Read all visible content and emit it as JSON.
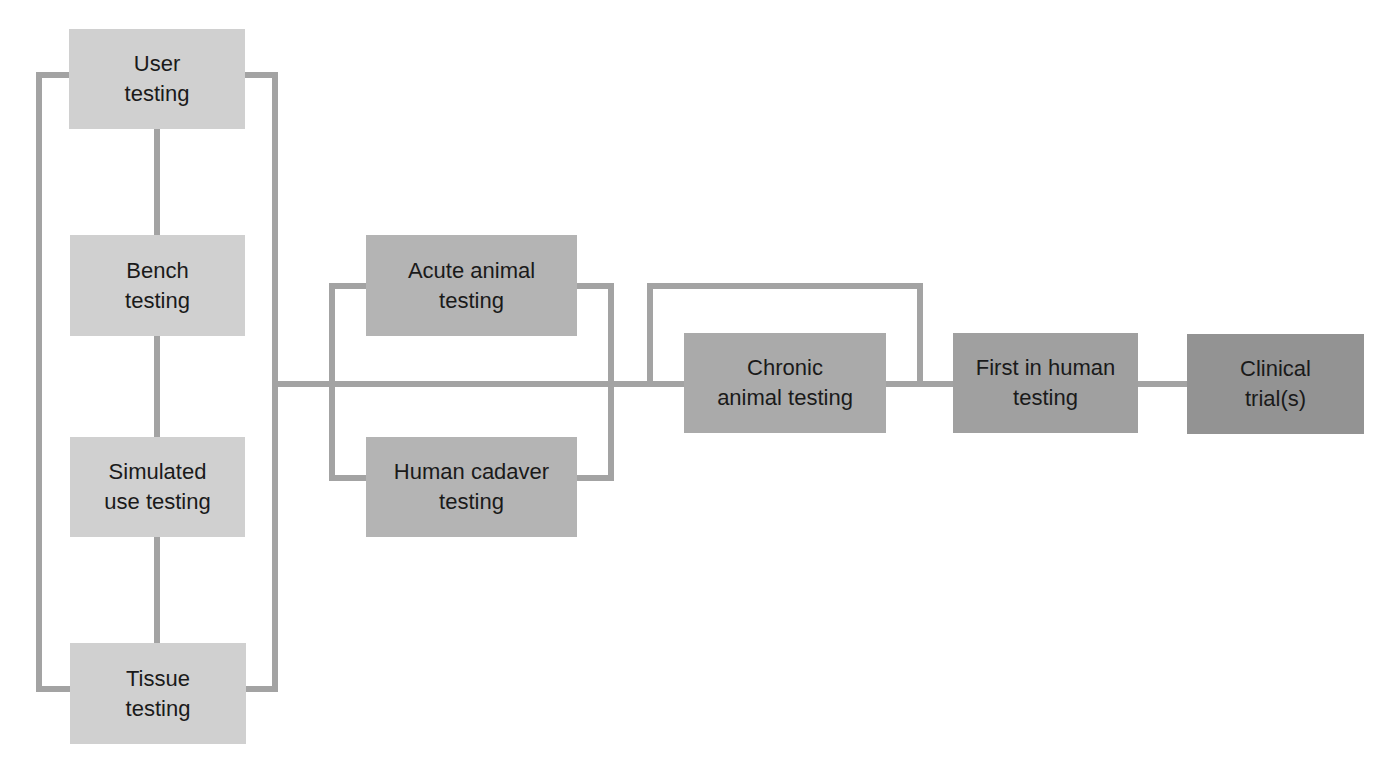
{
  "diagram": {
    "type": "flowchart",
    "colors": {
      "connector": "#a3a3a3",
      "stage1": "#d0d0d0",
      "stage2": "#b4b4b4",
      "stage3": "#aaaaaa",
      "stage4": "#a0a0a0",
      "stage5": "#939393"
    },
    "nodes": {
      "user_testing": "User\ntesting",
      "bench_testing": "Bench\ntesting",
      "simulated_use_testing": "Simulated\nuse testing",
      "tissue_testing": "Tissue\ntesting",
      "acute_animal_testing": "Acute animal\ntesting",
      "human_cadaver_testing": "Human cadaver\ntesting",
      "chronic_animal_testing": "Chronic\nanimal testing",
      "first_in_human_testing": "First in human\ntesting",
      "clinical_trials": "Clinical\ntrial(s)"
    },
    "edges": [
      [
        "user_testing",
        "bench_testing"
      ],
      [
        "bench_testing",
        "simulated_use_testing"
      ],
      [
        "simulated_use_testing",
        "tissue_testing"
      ],
      [
        "bench-group",
        "acute_animal_testing"
      ],
      [
        "bench-group",
        "human_cadaver_testing"
      ],
      [
        "acute/cadaver-group",
        "chronic_animal_testing"
      ],
      [
        "acute/cadaver-group",
        "first_in_human_testing"
      ],
      [
        "chronic_animal_testing",
        "first_in_human_testing"
      ],
      [
        "first_in_human_testing",
        "clinical_trials"
      ]
    ]
  }
}
